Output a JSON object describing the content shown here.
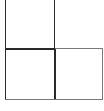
{
  "diagram": {
    "title": "",
    "cells": [
      {
        "id": "top-left",
        "label": ""
      },
      {
        "id": "bottom-left",
        "label": ""
      },
      {
        "id": "bottom-right",
        "label": ""
      }
    ],
    "colors": {
      "line": "#2a2a2a",
      "light_line": "#7a7a7a",
      "background": "#ffffff"
    }
  }
}
